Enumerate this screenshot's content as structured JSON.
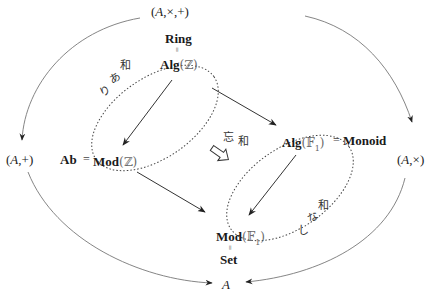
{
  "nodes": {
    "top": {
      "open": "(",
      "A": "A",
      "rest": ",×,+)"
    },
    "left": {
      "open": "(",
      "A": "A",
      "rest": ",+)"
    },
    "right": {
      "open": "(",
      "A": "A",
      "rest": ",×)"
    },
    "bottom": {
      "A": "A"
    },
    "ring": "Ring",
    "alg_z": {
      "bold": "Alg",
      "paren_open": "(",
      "bb": "ℤ",
      "paren_close": ")"
    },
    "ab": "Ab",
    "mod_z": {
      "bold": "Mod",
      "paren_open": "(",
      "bb": "ℤ",
      "paren_close": ")"
    },
    "alg_f1": {
      "bold": "Alg",
      "paren_open": "(",
      "bb": "𝔽",
      "sub": "1",
      "paren_close": ")"
    },
    "monoid": "Monoid",
    "mod_f1": {
      "bold": "Mod",
      "paren_open": "(",
      "bb": "𝔽",
      "sub": "1",
      "paren_close": ")"
    },
    "set": "Set"
  },
  "relations": {
    "ring_alg_z": "=",
    "ab_mod_z": "=",
    "alg_f1_monoid": "=",
    "mod_f1_set": "="
  },
  "annotations": {
    "with_sum": [
      "和",
      "あ",
      "り"
    ],
    "without_sum": [
      "和",
      "な",
      "し"
    ],
    "forget": "忘",
    "forget_sum": "和"
  },
  "colors": {
    "line": "#555555",
    "arrow": "#333333",
    "dotted": "#444444",
    "text": "#1a1a1a"
  }
}
